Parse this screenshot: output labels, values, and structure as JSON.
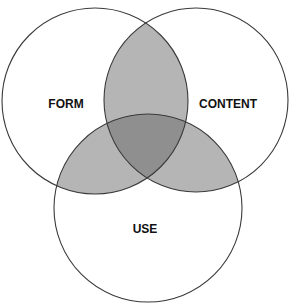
{
  "diagram": {
    "type": "venn",
    "sets": [
      {
        "id": "form",
        "label": "FORM"
      },
      {
        "id": "content",
        "label": "CONTENT"
      },
      {
        "id": "use",
        "label": "USE"
      }
    ],
    "colors": {
      "background": "#ffffff",
      "single": "#ffffff",
      "pair_overlap": "#b5b5b5",
      "triple_overlap": "#8f8f8f",
      "outline": "#3a3a3a"
    }
  }
}
